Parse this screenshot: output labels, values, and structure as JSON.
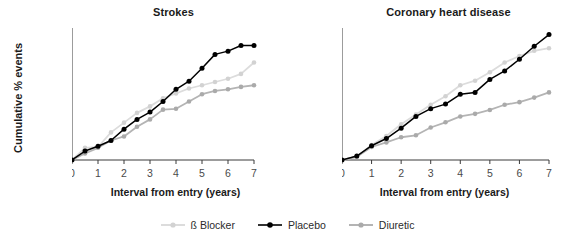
{
  "figure": {
    "ylabel": "Cumulative % events",
    "xlabel_left": "Interval from entry (years)",
    "xlabel_right": "Interval from entry (years)"
  },
  "legend": {
    "position": "bottom-center",
    "items": [
      {
        "label": "ß Blocker",
        "color": "#dcdcdc",
        "marker": "circle"
      },
      {
        "label": "Placebo",
        "color": "#000000",
        "marker": "circle"
      },
      {
        "label": "Diuretic",
        "color": "#b4b4b4",
        "marker": "circle"
      }
    ]
  },
  "chart_data": [
    {
      "type": "line",
      "title": "Strokes",
      "xlabel": "Interval from entry (years)",
      "ylabel": "Cumulative % events",
      "xlim": [
        0,
        7
      ],
      "ylim": [
        0,
        8
      ],
      "xticks": [
        0,
        1,
        2,
        3,
        4,
        5,
        6,
        7
      ],
      "yticks": [
        0,
        2,
        4,
        6,
        8
      ],
      "grid": false,
      "x": [
        0,
        0.5,
        1,
        1.5,
        2,
        2.5,
        3,
        3.5,
        4,
        4.5,
        5,
        5.5,
        6,
        6.5,
        7
      ],
      "series": [
        {
          "name": "ß Blocker",
          "color": "#dcdcdc",
          "values": [
            0,
            0.75,
            0.8,
            1.7,
            2.3,
            2.9,
            3.3,
            3.8,
            4.1,
            4.4,
            4.6,
            4.8,
            5.0,
            5.3,
            6.0
          ]
        },
        {
          "name": "Placebo",
          "color": "#000000",
          "values": [
            0,
            0.55,
            0.85,
            1.2,
            1.9,
            2.5,
            2.95,
            3.6,
            4.35,
            4.85,
            5.65,
            6.5,
            6.7,
            7.05,
            7.05
          ]
        },
        {
          "name": "Diuretic",
          "color": "#b4b4b4",
          "values": [
            0,
            0.4,
            0.75,
            1.2,
            1.45,
            2.05,
            2.5,
            3.1,
            3.15,
            3.6,
            4.05,
            4.25,
            4.35,
            4.5,
            4.6
          ]
        }
      ]
    },
    {
      "type": "line",
      "title": "Coronary heart disease",
      "xlabel": "Interval from entry (years)",
      "ylabel": "Cumulative % events",
      "xlim": [
        0,
        7
      ],
      "ylim": [
        0,
        10
      ],
      "xticks": [
        0,
        1,
        2,
        3,
        4,
        5,
        6,
        7
      ],
      "yticks": [
        0,
        2,
        4,
        6,
        8,
        10
      ],
      "grid": false,
      "x": [
        0,
        0.5,
        1,
        1.5,
        2,
        2.5,
        3,
        3.5,
        4,
        4.5,
        5,
        5.5,
        6,
        6.5,
        7
      ],
      "series": [
        {
          "name": "ß Blocker",
          "color": "#dcdcdc",
          "values": [
            0,
            0.25,
            1.15,
            1.85,
            2.75,
            3.5,
            4.25,
            4.9,
            5.75,
            6.1,
            6.75,
            7.5,
            8.0,
            8.4,
            8.6
          ]
        },
        {
          "name": "Placebo",
          "color": "#000000",
          "values": [
            0,
            0.3,
            1.1,
            1.65,
            2.45,
            3.35,
            3.95,
            4.3,
            5.05,
            5.2,
            6.2,
            6.85,
            7.75,
            8.75,
            9.65
          ]
        },
        {
          "name": "Diuretic",
          "color": "#b4b4b4",
          "values": [
            0,
            0.25,
            1.0,
            1.35,
            1.75,
            1.9,
            2.5,
            2.9,
            3.35,
            3.55,
            3.85,
            4.25,
            4.45,
            4.8,
            5.2
          ]
        }
      ]
    }
  ]
}
